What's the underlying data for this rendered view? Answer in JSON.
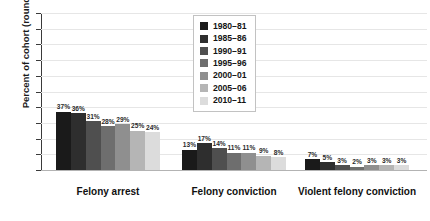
{
  "chart_data": {
    "type": "bar",
    "title": "",
    "xlabel": "",
    "ylabel": "Percent of cohort (rounded)",
    "ylim": [
      0,
      100
    ],
    "ytick_step": 10,
    "yticks": [
      0,
      10,
      20,
      30,
      40,
      50,
      60,
      70,
      80,
      90,
      100
    ],
    "grid": true,
    "legend_position": "top-center-right",
    "value_suffix": "%",
    "categories": [
      "Felony arrest",
      "Felony conviction",
      "Violent felony conviction"
    ],
    "series": [
      {
        "name": "1980–81",
        "color": "#1a1a1a",
        "values": [
          37,
          13,
          7
        ]
      },
      {
        "name": "1985–86",
        "color": "#2e2e2e",
        "values": [
          36,
          17,
          5
        ]
      },
      {
        "name": "1990–91",
        "color": "#4f4f4f",
        "values": [
          31,
          14,
          3
        ]
      },
      {
        "name": "1995–96",
        "color": "#6e6e6e",
        "values": [
          28,
          11,
          2
        ]
      },
      {
        "name": "2000–01",
        "color": "#8f8f8f",
        "values": [
          29,
          11,
          3
        ]
      },
      {
        "name": "2005–06",
        "color": "#b5b5b5",
        "values": [
          25,
          9,
          3
        ]
      },
      {
        "name": "2010–11",
        "color": "#dcdcdc",
        "values": [
          24,
          8,
          3
        ]
      }
    ],
    "data_labels": [
      [
        "37%",
        "36%",
        "31%",
        "28%",
        "29%",
        "25%",
        "24%"
      ],
      [
        "13%",
        "17%",
        "14%",
        "11%",
        "11%",
        "9%",
        "8%"
      ],
      [
        "7%",
        "5%",
        "3%",
        "2%",
        "3%",
        "3%",
        "3%"
      ]
    ],
    "ytick_labels": [
      "0",
      "10",
      "20",
      "30",
      "40",
      "50",
      "60",
      "70",
      "80",
      "90",
      "100"
    ]
  },
  "legend": {
    "items": [
      {
        "label": "1980–81"
      },
      {
        "label": "1985–86"
      },
      {
        "label": "1990–91"
      },
      {
        "label": "1995–96"
      },
      {
        "label": "2000–01"
      },
      {
        "label": "2005–06"
      },
      {
        "label": "2010–11"
      }
    ]
  },
  "colors": {
    "background": "#ffffff",
    "gridline": "#e6e6e6",
    "axis": "#3a3a3a",
    "baseline": "#b3b3b3",
    "text": "#111111"
  }
}
